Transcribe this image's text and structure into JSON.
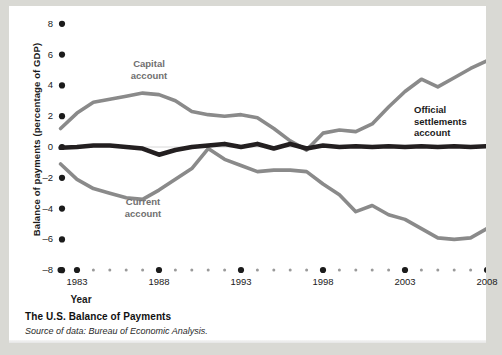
{
  "figure": {
    "caption_title": "The U.S. Balance of Payments",
    "caption_source": "Source of data: Bureau of Economic Analysis."
  },
  "chart_data": {
    "type": "line",
    "title": "The U.S. Balance of Payments",
    "xlabel": "Year",
    "ylabel": "Balance of payments (percentage of GDP)",
    "xlim": [
      1982,
      2008
    ],
    "ylim": [
      -8,
      8
    ],
    "ytick_labels": [
      "8",
      "6",
      "4",
      "2",
      "0",
      "–2",
      "–4",
      "–6",
      "–8"
    ],
    "ytick_values": [
      8,
      6,
      4,
      2,
      0,
      -2,
      -4,
      -6,
      -8
    ],
    "xtick_labels": [
      "1983",
      "1988",
      "1993",
      "1998",
      "2003",
      "2008"
    ],
    "xtick_values": [
      1983,
      1988,
      1993,
      1998,
      2003,
      2008
    ],
    "x": [
      1982,
      1983,
      1984,
      1985,
      1986,
      1987,
      1988,
      1989,
      1990,
      1991,
      1992,
      1993,
      1994,
      1995,
      1996,
      1997,
      1998,
      1999,
      2000,
      2001,
      2002,
      2003,
      2004,
      2005,
      2006,
      2007,
      2008
    ],
    "grid": false,
    "legend": "inline-annotations",
    "series": [
      {
        "name": "Capital account",
        "color": "#8a8a8a",
        "label_text": "Capital\naccount",
        "values": [
          1.2,
          2.2,
          2.9,
          3.1,
          3.3,
          3.5,
          3.4,
          3.0,
          2.3,
          2.1,
          2.0,
          2.1,
          1.9,
          1.2,
          0.4,
          -0.2,
          0.9,
          1.1,
          1.0,
          1.5,
          2.6,
          3.6,
          4.4,
          3.9,
          4.5,
          5.1,
          5.6
        ]
      },
      {
        "name": "Current account",
        "color": "#8a8a8a",
        "label_text": "Current\naccount",
        "values": [
          -1.1,
          -2.1,
          -2.7,
          -3.0,
          -3.3,
          -3.4,
          -2.8,
          -2.1,
          -1.4,
          -0.1,
          -0.8,
          -1.2,
          -1.6,
          -1.5,
          -1.5,
          -1.6,
          -2.4,
          -3.1,
          -4.2,
          -3.8,
          -4.4,
          -4.7,
          -5.3,
          -5.9,
          -6.0,
          -5.9,
          -5.3
        ]
      },
      {
        "name": "Official settlements account",
        "color": "#231f20",
        "label_text": "Official\nsettlements\naccount",
        "values": [
          -0.05,
          0.0,
          0.1,
          0.1,
          0.0,
          -0.1,
          -0.5,
          -0.2,
          0.0,
          0.1,
          0.2,
          0.0,
          0.2,
          -0.1,
          0.2,
          -0.1,
          0.1,
          0.0,
          0.05,
          0.0,
          0.05,
          0.0,
          0.05,
          0.0,
          0.05,
          0.0,
          0.05
        ]
      }
    ],
    "axis_geometry": {
      "x0_px": 68,
      "x_step_px": 16.4,
      "y0_px": 141,
      "y_unit_px": 15.4,
      "tick_dot_x_px": 53,
      "tick_dot_y_px": 264
    }
  }
}
